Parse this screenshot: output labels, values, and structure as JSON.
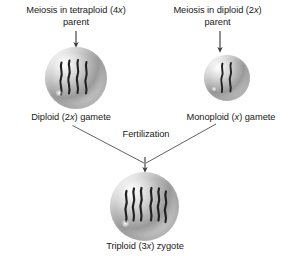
{
  "diagram": {
    "background_color": "#ffffff",
    "text_color": "#1a1a1a",
    "line_color": "#4a4a4a",
    "chromosome_color": "#222222"
  },
  "left_branch": {
    "heading_line1": "Meiosis in tetraploid (4x)",
    "heading_line2": "parent",
    "heading_italic_token": "x",
    "gamete_label": "Diploid (2x) gamete",
    "chromosome_count": 4,
    "cell_name": "diploid-gamete"
  },
  "right_branch": {
    "heading_line1": "Meiosis in diploid (2x)",
    "heading_line2": "parent",
    "heading_italic_token": "x",
    "gamete_label": "Monoploid (x) gamete",
    "chromosome_count": 2,
    "cell_name": "monoploid-gamete"
  },
  "fertilization": {
    "label": "Fertilization"
  },
  "zygote": {
    "label": "Triploid (3x) zygote",
    "chromosome_count": 6,
    "cell_name": "triploid-zygote"
  },
  "icons": {
    "down_arrow": "down-arrow-icon",
    "merge_arrow": "merge-arrow-icon"
  }
}
